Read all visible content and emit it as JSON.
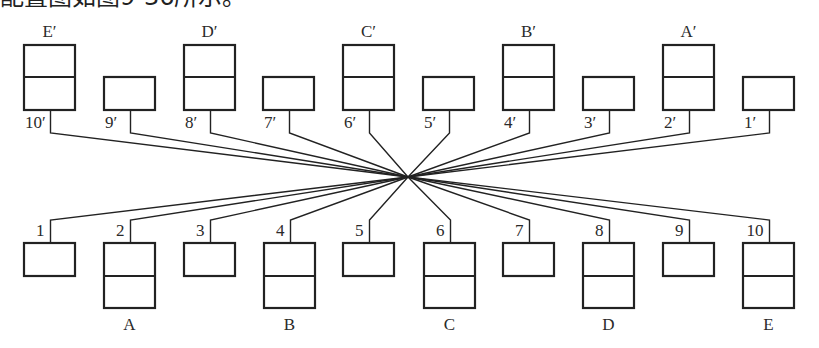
{
  "caption": "配置图如图9-36所示。",
  "diagram": {
    "center": {
      "x": 408,
      "y": 177
    },
    "top_row": {
      "box_top_tall": 45,
      "box_top_small": 77,
      "box_bottom": 110,
      "bend_y": 133,
      "items": [
        {
          "port": "10′",
          "unit": "E′",
          "x": 24,
          "tall": true
        },
        {
          "port": "9′",
          "unit": "",
          "x": 104,
          "tall": false
        },
        {
          "port": "8′",
          "unit": "D′",
          "x": 184,
          "tall": true
        },
        {
          "port": "7′",
          "unit": "",
          "x": 263,
          "tall": false
        },
        {
          "port": "6′",
          "unit": "C′",
          "x": 343,
          "tall": true
        },
        {
          "port": "5′",
          "unit": "",
          "x": 423,
          "tall": false
        },
        {
          "port": "4′",
          "unit": "B′",
          "x": 503,
          "tall": true
        },
        {
          "port": "3′",
          "unit": "",
          "x": 583,
          "tall": false
        },
        {
          "port": "2′",
          "unit": "A′",
          "x": 663,
          "tall": true
        },
        {
          "port": "1′",
          "unit": "",
          "x": 743,
          "tall": false
        }
      ]
    },
    "bottom_row": {
      "box_top": 243,
      "box_bottom_small": 276,
      "box_bottom_tall": 308,
      "bend_y": 220,
      "items": [
        {
          "port": "1",
          "unit": "",
          "x": 24,
          "tall": false
        },
        {
          "port": "2",
          "unit": "A",
          "x": 104,
          "tall": true
        },
        {
          "port": "3",
          "unit": "",
          "x": 184,
          "tall": false
        },
        {
          "port": "4",
          "unit": "B",
          "x": 264,
          "tall": true
        },
        {
          "port": "5",
          "unit": "",
          "x": 343,
          "tall": false
        },
        {
          "port": "6",
          "unit": "C",
          "x": 424,
          "tall": true
        },
        {
          "port": "7",
          "unit": "",
          "x": 503,
          "tall": false
        },
        {
          "port": "8",
          "unit": "D",
          "x": 583,
          "tall": true
        },
        {
          "port": "9",
          "unit": "",
          "x": 663,
          "tall": false
        },
        {
          "port": "10",
          "unit": "E",
          "x": 743,
          "tall": true
        }
      ]
    },
    "box_width": 51,
    "colors": {
      "stroke": "#222222",
      "background": "#ffffff"
    }
  }
}
